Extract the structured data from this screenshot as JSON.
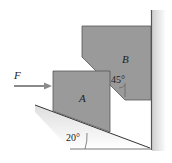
{
  "diagram": {
    "labels": {
      "force": "F",
      "block_a": "A",
      "block_b": "B",
      "angle_wedge": "45°",
      "angle_incline": "20°"
    },
    "colors": {
      "block_fill": "#9a9a9a",
      "block_stroke": "#555555",
      "line": "#444444",
      "arrow": "#8a8a8a",
      "wall_shade": "#d8d8d8"
    }
  }
}
